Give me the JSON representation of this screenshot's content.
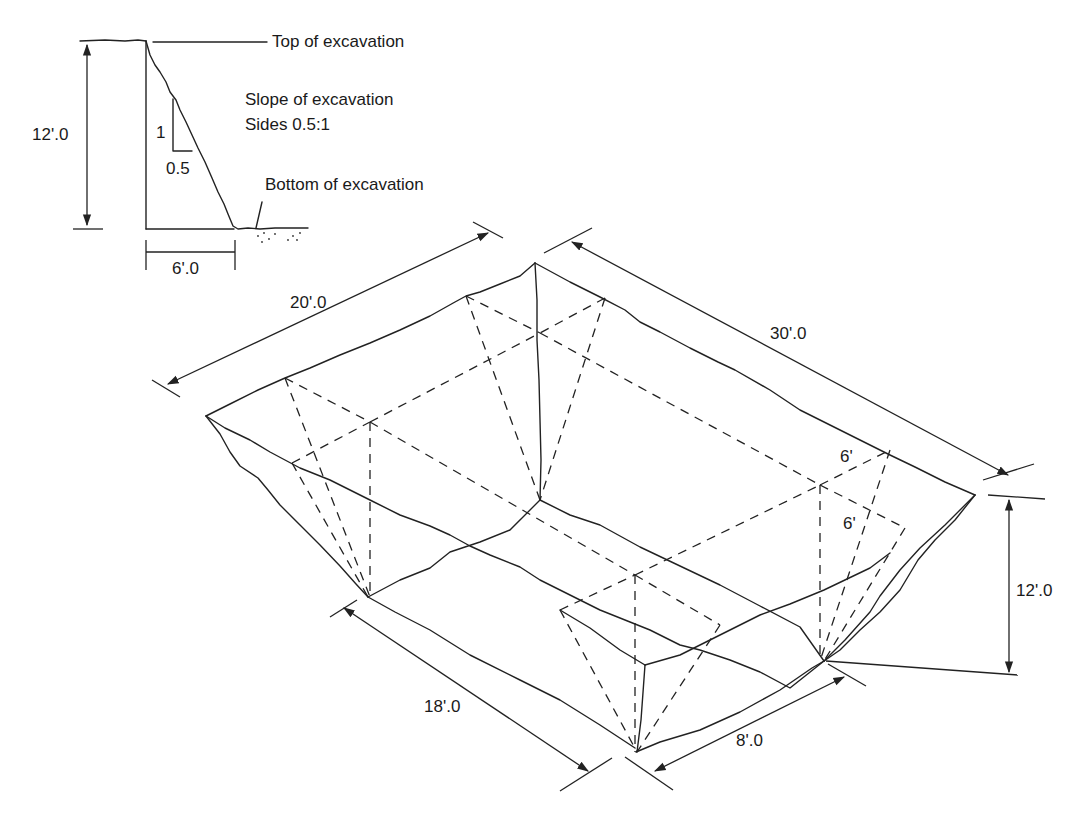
{
  "diagram": {
    "colors": {
      "line": "#222222",
      "background": "#ffffff"
    },
    "section": {
      "top_label": "Top of excavation",
      "slope_title": "Slope of excavation",
      "slope_ratio": "Sides 0.5:1",
      "rise_label": "1",
      "run_label": "0.5",
      "bottom_label": "Bottom of excavation",
      "depth_label": "12'.0",
      "offset_label": "6'.0"
    },
    "isometric": {
      "top_width_label": "20'.0",
      "top_length_label": "30'.0",
      "bottom_length_label": "18'.0",
      "bottom_width_label": "8'.0",
      "depth_label": "12'.0",
      "slope_offset_label_1": "6'",
      "slope_offset_label_2": "6'"
    }
  }
}
